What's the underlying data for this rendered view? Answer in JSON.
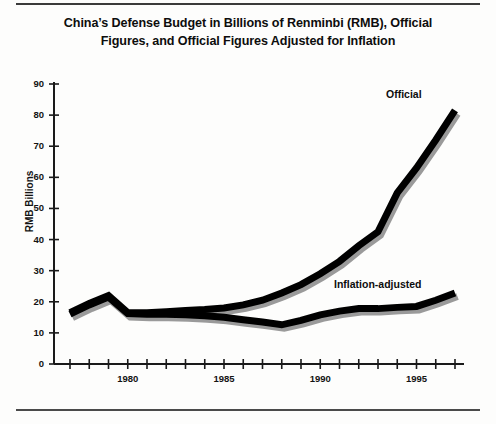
{
  "chart_data": {
    "type": "line",
    "title": "China’s Defense Budget in Billions of Renminbi (RMB), Official Figures, and Official Figures Adjusted for Inflation",
    "xlabel": "",
    "ylabel": "RMB Billions",
    "xlim": [
      1977,
      1997.5
    ],
    "ylim": [
      0,
      90
    ],
    "ytick_values": [
      0,
      10,
      20,
      30,
      40,
      50,
      60,
      70,
      80,
      90
    ],
    "ytick_labels": [
      "0",
      "10",
      "20",
      "30",
      "40",
      "50",
      "60",
      "70",
      "80",
      "90"
    ],
    "xtick_values": [
      1977,
      1978,
      1979,
      1980,
      1981,
      1982,
      1983,
      1984,
      1985,
      1986,
      1987,
      1988,
      1989,
      1990,
      1991,
      1992,
      1993,
      1994,
      1995,
      1996,
      1997
    ],
    "xtick_labels": [
      "",
      "",
      "",
      "1980",
      "",
      "",
      "",
      "",
      "1985",
      "",
      "",
      "",
      "",
      "1990",
      "",
      "",
      "",
      "",
      "1995",
      "",
      ""
    ],
    "grid": false,
    "legend_position": "inline-annotations",
    "x": [
      1977,
      1978,
      1979,
      1980,
      1981,
      1982,
      1983,
      1984,
      1985,
      1986,
      1987,
      1988,
      1989,
      1990,
      1991,
      1992,
      1993,
      1994,
      1995,
      1996,
      1997
    ],
    "series": [
      {
        "name": "Official",
        "label": "Official",
        "color": "#000000",
        "shadow_color": "#9a9a9a",
        "values": [
          16.5,
          19.5,
          22.0,
          16.5,
          16.5,
          16.8,
          17.2,
          17.5,
          18.0,
          19.0,
          20.5,
          22.8,
          25.5,
          29.0,
          33.0,
          38.0,
          42.5,
          55.0,
          63.0,
          72.0,
          81.5
        ]
      },
      {
        "name": "Inflation-adjusted",
        "label": "Inflation-adjusted",
        "color": "#000000",
        "shadow_color": "#9a9a9a",
        "values": [
          16.0,
          19.0,
          21.5,
          16.2,
          16.0,
          16.0,
          15.8,
          15.5,
          15.0,
          14.2,
          13.5,
          12.6,
          14.0,
          15.8,
          17.0,
          17.8,
          17.8,
          18.2,
          18.5,
          20.5,
          22.8
        ]
      }
    ]
  },
  "axis": {
    "y_title": "RMB Billions"
  }
}
